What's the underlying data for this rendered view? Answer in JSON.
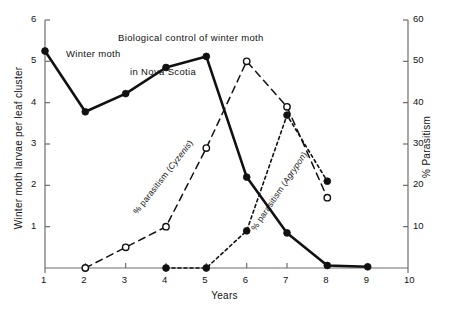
{
  "chart_data": {
    "type": "line",
    "title": "Biological control of winter moth in Nova Scotia",
    "title_line1": "Biological control of winter moth",
    "title_line2": "in Nova Scotia",
    "xlabel": "Years",
    "ylabel": "Winter moth larvae per leaf cluster",
    "y2label": "% Parasitism",
    "xlim": [
      1,
      10
    ],
    "ylim": [
      0,
      6
    ],
    "y2lim": [
      0,
      60
    ],
    "xticks": [
      1,
      2,
      3,
      4,
      5,
      6,
      7,
      8,
      9,
      10
    ],
    "xtick_labels": [
      "1",
      "2",
      "3",
      "4",
      "5",
      "6",
      "7",
      "8",
      "9",
      "10"
    ],
    "yticks": [
      1,
      2,
      3,
      4,
      5,
      6
    ],
    "ytick_labels": [
      "1",
      "2",
      "3",
      "4",
      "5",
      "6"
    ],
    "y2ticks": [
      10,
      20,
      30,
      40,
      50,
      60
    ],
    "y2tick_labels": [
      "10",
      "20",
      "30",
      "40",
      "50",
      "60"
    ],
    "grid": false,
    "legend": "none (inline annotations)",
    "series": [
      {
        "name": "Winter moth",
        "axis": "left",
        "marker": "filled-circle",
        "line": "solid",
        "x": [
          1,
          2,
          3,
          4,
          5,
          6,
          7,
          8,
          9
        ],
        "values": [
          5.25,
          3.78,
          4.22,
          4.85,
          5.12,
          2.2,
          0.85,
          0.06,
          0.03
        ]
      },
      {
        "name": "% parasitism (Cyzenis)",
        "axis": "right",
        "marker": "open-circle",
        "line": "long-dashed",
        "x": [
          2,
          3,
          4,
          5,
          6,
          7,
          8
        ],
        "values": [
          0,
          5,
          10,
          29,
          50,
          39,
          17
        ]
      },
      {
        "name": "% parasitism (Agrypon)",
        "axis": "right",
        "marker": "filled-circle",
        "line": "short-dashed",
        "x": [
          4,
          5,
          6,
          7,
          8
        ],
        "values": [
          0,
          0,
          9,
          37,
          21
        ]
      }
    ],
    "annotations": [
      {
        "text": "Winter moth",
        "series": "Winter moth",
        "rotation": 0
      },
      {
        "text": "% parasitism (Cyzenis)",
        "series": "% parasitism (Cyzenis)",
        "rotation": -52
      },
      {
        "text": "% parasitism (Agrypon)",
        "series": "% parasitism (Agrypon)",
        "rotation": -56
      }
    ],
    "annotation_cyzenis_prefix": "% parasitism (",
    "annotation_cyzenis_italic": "Cyzenis",
    "annotation_cyzenis_suffix": ")",
    "annotation_agrypon_prefix": "% parasitism (",
    "annotation_agrypon_italic": "Agrypon",
    "annotation_agrypon_suffix": ")",
    "colors": {
      "ink": "#111111",
      "axis": "#6d6d6d",
      "background": "#ffffff"
    }
  }
}
